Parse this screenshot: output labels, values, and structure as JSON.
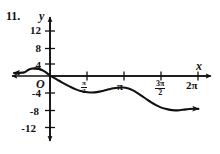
{
  "figure": {
    "problem_number": "11.",
    "axis_label_x": "x",
    "axis_label_y": "y",
    "origin_label": "O"
  },
  "colors": {
    "curve": "#111111",
    "axis": "#111111",
    "background": "#ffffff",
    "text": "#111111"
  },
  "chart_data": {
    "type": "line",
    "title": "",
    "xlabel": "x",
    "ylabel": "y",
    "grid": false,
    "legend": null,
    "xlim": [
      -1.1,
      6.6
    ],
    "ylim": [
      -14.5,
      14.5
    ],
    "y_ticks": [
      12,
      8,
      4,
      -4,
      -8,
      -12
    ],
    "y_tick_labels": [
      "12",
      "8",
      "4",
      "-4",
      "-8",
      "-12"
    ],
    "x_ticks": [
      1.5707963,
      3.1415927,
      4.712389,
      6.2831853
    ],
    "x_tick_labels": [
      "pi/2",
      "pi",
      "3pi/2",
      "2pi"
    ],
    "x_tick_label_parts": [
      {
        "kind": "fraction",
        "numerator": "π",
        "denominator": "2"
      },
      {
        "kind": "plain",
        "text": "π"
      },
      {
        "kind": "fraction",
        "numerator": "3π",
        "denominator": "2"
      },
      {
        "kind": "plain",
        "text": "2π"
      }
    ],
    "series": [
      {
        "name": "curve",
        "arrow_start": true,
        "arrow_end": true,
        "x": [
          -1.1,
          -0.95,
          -0.8,
          -0.65,
          -0.5,
          -0.35,
          -0.2,
          -0.05,
          0.1,
          0.3,
          0.5,
          0.7,
          0.9,
          1.1,
          1.3,
          1.5,
          1.7,
          1.9,
          2.1,
          2.3,
          2.5,
          2.7,
          2.9,
          3.1,
          3.3,
          3.5,
          3.7,
          3.9,
          4.1,
          4.3,
          4.5,
          4.7,
          4.9,
          5.1,
          5.3,
          5.5,
          5.7,
          5.9,
          6.1,
          6.3
        ],
        "y": [
          1.2,
          1.9,
          2.4,
          2.55,
          2.4,
          2.0,
          1.35,
          0.45,
          -0.3,
          -1.2,
          -2.1,
          -2.95,
          -3.75,
          -4.45,
          -5.0,
          -5.35,
          -5.5,
          -5.45,
          -5.2,
          -4.85,
          -4.45,
          -4.1,
          -3.9,
          -3.85,
          -4.1,
          -4.7,
          -5.6,
          -6.65,
          -7.75,
          -8.8,
          -9.7,
          -10.45,
          -10.95,
          -11.3,
          -11.45,
          -11.4,
          -11.2,
          -11.0,
          -10.9,
          -10.95
        ]
      }
    ],
    "features": {
      "local_max_left": {
        "x": -0.65,
        "y": 2.55
      },
      "local_min_1": {
        "x": 1.7,
        "y": -5.5
      },
      "local_max_1": {
        "x": 3.1,
        "y": -3.85
      },
      "local_min_2": {
        "x": 5.3,
        "y": -11.45
      }
    }
  }
}
